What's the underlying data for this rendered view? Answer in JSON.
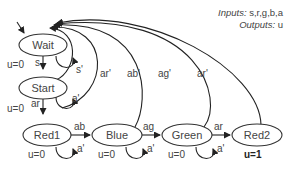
{
  "legend": {
    "inputs_label": "Inputs:",
    "inputs_value": " s,r,g,b,a",
    "outputs_label": "Outputs:",
    "outputs_value": " u"
  },
  "states": [
    {
      "id": "wait",
      "label": "Wait",
      "output": "u=0"
    },
    {
      "id": "start",
      "label": "Start",
      "output": "u=0"
    },
    {
      "id": "red1",
      "label": "Red1",
      "output": "u=0"
    },
    {
      "id": "blue",
      "label": "Blue",
      "output": "u=0"
    },
    {
      "id": "green",
      "label": "Green",
      "output": "u=0"
    },
    {
      "id": "red2",
      "label": "Red2",
      "output": "u=1"
    }
  ],
  "transitions": [
    {
      "from": "wait",
      "to": "start",
      "label": "s"
    },
    {
      "from": "wait",
      "to": "wait",
      "label": "s'"
    },
    {
      "from": "start",
      "to": "red1",
      "label": "ar"
    },
    {
      "from": "start",
      "to": "start",
      "label": "a'"
    },
    {
      "from": "red1",
      "to": "blue",
      "label": "ab"
    },
    {
      "from": "red1",
      "to": "red1",
      "label": "a'"
    },
    {
      "from": "blue",
      "to": "green",
      "label": "ag"
    },
    {
      "from": "blue",
      "to": "blue",
      "label": "a'"
    },
    {
      "from": "green",
      "to": "red2",
      "label": "ar"
    },
    {
      "from": "green",
      "to": "green",
      "label": "a'"
    },
    {
      "from": "start",
      "to": "wait",
      "label": "ar'"
    },
    {
      "from": "red1",
      "to": "wait",
      "label": "ab'"
    },
    {
      "from": "blue",
      "to": "wait",
      "label": "ag'"
    },
    {
      "from": "green",
      "to": "wait",
      "label": "ar'"
    },
    {
      "from": "red2",
      "to": "wait",
      "label": ""
    }
  ]
}
